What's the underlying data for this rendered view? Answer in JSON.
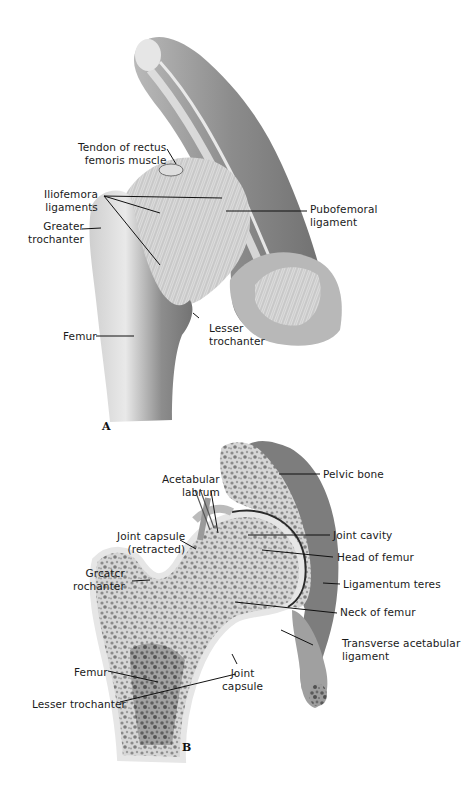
{
  "figure": {
    "panel_a": {
      "letter": "A",
      "labels": {
        "tendon_rectus_femoris": "Tendon of rectus\nfemoris muscle",
        "iliofemoral_ligaments": "Iliofemora\nligaments",
        "greater_trochanter": "Greater\ntrochanter",
        "pubofemoral_ligament": "Pubofemoral\nligament",
        "femur": "Femur",
        "lesser_trochanter": "Lesser\ntrochanter"
      }
    },
    "panel_b": {
      "letter": "B",
      "labels": {
        "pelvic_bone": "Pelvic bone",
        "acetabular_labrum": "Acetabular\nlabrum",
        "joint_capsule_retracted": "Joint capsule\n(retracted)",
        "joint_cavity": "Joint cavity",
        "head_of_femur": "Head of femur",
        "greater_trochanter": "Grcatcr\nrochanter",
        "ligamentum_teres": "Ligamentum teres",
        "neck_of_femur": "Neck of femur",
        "transverse_acetabular_ligament": "Transverse acetabular\nligament",
        "femur": "Femur",
        "joint_capsule": "Joint\ncapsule",
        "lesser_trochanter": "Lesser trochanter"
      }
    }
  }
}
